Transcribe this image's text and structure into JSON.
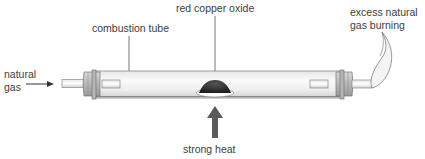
{
  "diagram": {
    "labels": {
      "red_copper_oxide": "red copper oxide",
      "combustion_tube": "combustion tube",
      "excess_gas_line1": "excess natural",
      "excess_gas_line2": "gas burning",
      "natural_gas_line1": "natural",
      "natural_gas_line2": "gas",
      "strong_heat": "strong heat"
    },
    "colors": {
      "tube_fill": "#f2f2f2",
      "tube_outline": "#8a8a8a",
      "stopper": "#c8c8c8",
      "copper_oxide": "#2e2e2e",
      "heat_arrow": "#5a5a5a",
      "leader_line": "#555555"
    }
  }
}
